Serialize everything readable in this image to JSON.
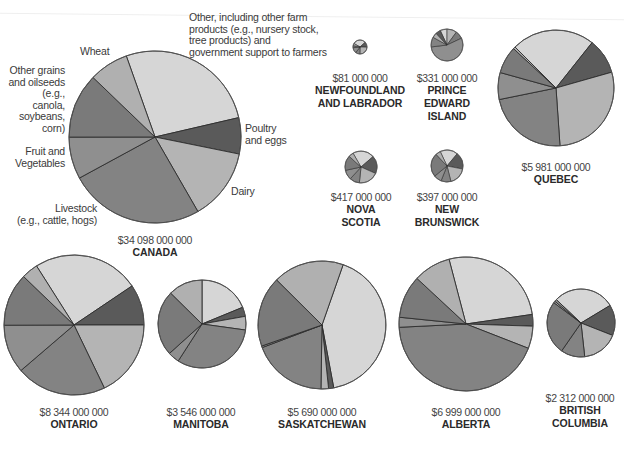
{
  "chart_data": {
    "type": "pie",
    "unit": "$",
    "category_legend": [
      {
        "key": "other",
        "label": "Other, including other farm products (e.g., nursery stock, tree products) and government support to farmers",
        "color": "#d6d6d6"
      },
      {
        "key": "poultry",
        "label": "Poultry and eggs",
        "color": "#5a5a5a"
      },
      {
        "key": "dairy",
        "label": "Dairy",
        "color": "#b4b4b4"
      },
      {
        "key": "livestock",
        "label": "Livestock (e.g., cattle, hogs)",
        "color": "#838383"
      },
      {
        "key": "fruit",
        "label": "Fruit and Vegetables",
        "color": "#8f8f8f"
      },
      {
        "key": "grains",
        "label": "Other grains and oilseeds (e.g., canola, soybeans, corn)",
        "color": "#7a7a7a"
      },
      {
        "key": "wheat",
        "label": "Wheat",
        "color": "#b0b0b0"
      }
    ],
    "pies": [
      {
        "region": "CANADA",
        "total": "$34 098 000 000",
        "cx": 155,
        "cy": 137,
        "r": 86,
        "start": -19.5,
        "slices": [
          [
            "other",
            26.8
          ],
          [
            "poultry",
            6.8
          ],
          [
            "dairy",
            13.5
          ],
          [
            "livestock",
            25.4
          ],
          [
            "fruit",
            7.9
          ],
          [
            "grains",
            12.2
          ],
          [
            "wheat",
            7.4
          ]
        ]
      },
      {
        "region": "NEWFOUNDLAND AND LABRADOR",
        "total": "$81 000 000",
        "cx": 360,
        "cy": 47,
        "r": 7,
        "start": -60,
        "slices": [
          [
            "other",
            30
          ],
          [
            "poultry",
            12
          ],
          [
            "dairy",
            25
          ],
          [
            "livestock",
            10
          ],
          [
            "fruit",
            13
          ],
          [
            "grains",
            5
          ],
          [
            "wheat",
            5
          ]
        ]
      },
      {
        "region": "PRINCE EDWARD ISLAND",
        "total": "$331 000 000",
        "cx": 447,
        "cy": 45,
        "r": 16,
        "start": -25,
        "slices": [
          [
            "other",
            7
          ],
          [
            "dairy",
            10
          ],
          [
            "grains",
            8
          ],
          [
            "fruit",
            55
          ],
          [
            "livestock",
            10
          ],
          [
            "wheat",
            5
          ],
          [
            "poultry",
            5
          ]
        ]
      },
      {
        "region": "NOVA SCOTIA",
        "total": "$417 000 000",
        "cx": 361,
        "cy": 167,
        "r": 16,
        "start": -30,
        "slices": [
          [
            "other",
            22
          ],
          [
            "poultry",
            18
          ],
          [
            "dairy",
            20
          ],
          [
            "livestock",
            10
          ],
          [
            "fruit",
            10
          ],
          [
            "grains",
            15
          ],
          [
            "wheat",
            5
          ]
        ]
      },
      {
        "region": "NEW BRUNSWICK",
        "total": "$397 000 000",
        "cx": 447,
        "cy": 166,
        "r": 16,
        "start": -25,
        "slices": [
          [
            "other",
            18
          ],
          [
            "poultry",
            17
          ],
          [
            "dairy",
            18
          ],
          [
            "livestock",
            10
          ],
          [
            "fruit",
            8
          ],
          [
            "grains",
            24
          ],
          [
            "wheat",
            5
          ]
        ]
      },
      {
        "region": "QUEBEC",
        "total": "$5 981 000 000",
        "cx": 556,
        "cy": 88,
        "r": 58,
        "start": -45,
        "slices": [
          [
            "other",
            23.2
          ],
          [
            "poultry",
            9.9
          ],
          [
            "dairy",
            28.3
          ],
          [
            "livestock",
            22.9
          ],
          [
            "fruit",
            7.5
          ],
          [
            "grains",
            7.6
          ],
          [
            "wheat",
            0.6
          ]
        ]
      },
      {
        "region": "ONTARIO",
        "total": "$8 344 000 000",
        "cx": 74,
        "cy": 325,
        "r": 70,
        "start": -32.4,
        "slices": [
          [
            "other",
            24.5
          ],
          [
            "poultry",
            9.4
          ],
          [
            "dairy",
            17.8
          ],
          [
            "livestock",
            20.8
          ],
          [
            "fruit",
            11.2
          ],
          [
            "grains",
            12.2
          ],
          [
            "wheat",
            3.8
          ]
        ]
      },
      {
        "region": "MANITOBA",
        "total": "$3 546 000 000",
        "cx": 202,
        "cy": 324,
        "r": 44,
        "start": 0,
        "slices": [
          [
            "other",
            18.8
          ],
          [
            "poultry",
            3.4
          ],
          [
            "dairy",
            5.0
          ],
          [
            "livestock",
            31.9
          ],
          [
            "fruit",
            4.2
          ],
          [
            "grains",
            24.1
          ],
          [
            "wheat",
            12.6
          ]
        ]
      },
      {
        "region": "SASKATCHEWAN",
        "total": "$5 690 000 000",
        "cx": 322,
        "cy": 325,
        "r": 64,
        "start": 19.3,
        "slices": [
          [
            "other",
            41.7
          ],
          [
            "poultry",
            1.3
          ],
          [
            "dairy",
            1.9
          ],
          [
            "livestock",
            19.0
          ],
          [
            "fruit",
            0.4
          ],
          [
            "grains",
            17.8
          ],
          [
            "wheat",
            17.9
          ]
        ]
      },
      {
        "region": "ALBERTA",
        "total": "$6 999 000 000",
        "cx": 466,
        "cy": 324,
        "r": 67,
        "start": -14.7,
        "slices": [
          [
            "other",
            26.8
          ],
          [
            "poultry",
            2.8
          ],
          [
            "dairy",
            5.4
          ],
          [
            "livestock",
            43.3
          ],
          [
            "fruit",
            2.4
          ],
          [
            "grains",
            10.3
          ],
          [
            "wheat",
            9.0
          ]
        ]
      },
      {
        "region": "BRITISH COLUMBIA",
        "total": "$2 312 000 000",
        "cx": 581,
        "cy": 323,
        "r": 34,
        "start": -46.6,
        "slices": [
          [
            "other",
            29.3
          ],
          [
            "poultry",
            14.6
          ],
          [
            "dairy",
            17.3
          ],
          [
            "livestock",
            11.4
          ],
          [
            "grains",
            25.6
          ],
          [
            "wheat",
            0.8
          ],
          [
            "fruit",
            1.0
          ]
        ]
      }
    ],
    "annotations": {
      "other": "Other, including other farm products (e.g., nursery stock, tree products) and government support to farmers",
      "wheat": "Wheat",
      "grains": "Other grains and oilseeds (e.g., canola, soybeans, corn)",
      "fruit": "Fruit and Vegetables",
      "livestock": "Livestock (e.g., cattle, hogs)",
      "poultry": "Poultry and eggs",
      "dairy": "Dairy"
    }
  },
  "labels": {
    "other_lines": [
      "Other, including other farm",
      "products (e.g., nursery stock,",
      "tree products) and",
      "government support to farmers"
    ],
    "wheat": "Wheat",
    "grains_lines": [
      "Other grains",
      "and oilseeds",
      "(e.g., canola,",
      "soybeans,",
      "corn)"
    ],
    "fruit_lines": [
      "Fruit and",
      "Vegetables"
    ],
    "livestock_lines": [
      "Livestock",
      "(e.g., cattle, hogs)"
    ],
    "poultry_lines": [
      "Poultry",
      "and eggs"
    ],
    "dairy": "Dairy"
  },
  "captions": [
    {
      "value": "$34 098 000 000",
      "name_lines": [
        "CANADA"
      ]
    },
    {
      "value": "$81 000 000",
      "name_lines": [
        "NEWFOUNDLAND",
        "AND LABRADOR"
      ]
    },
    {
      "value": "$331 000 000",
      "name_lines": [
        "PRINCE",
        "EDWARD",
        "ISLAND"
      ]
    },
    {
      "value": "$417 000 000",
      "name_lines": [
        "NOVA",
        "SCOTIA"
      ]
    },
    {
      "value": "$397 000 000",
      "name_lines": [
        "NEW",
        "BRUNSWICK"
      ]
    },
    {
      "value": "$5 981 000 000",
      "name_lines": [
        "QUEBEC"
      ]
    },
    {
      "value": "$8 344 000 000",
      "name_lines": [
        "ONTARIO"
      ]
    },
    {
      "value": "$3 546 000 000",
      "name_lines": [
        "MANITOBA"
      ]
    },
    {
      "value": "$5 690 000 000",
      "name_lines": [
        "SASKATCHEWAN"
      ]
    },
    {
      "value": "$6 999 000 000",
      "name_lines": [
        "ALBERTA"
      ]
    },
    {
      "value": "$2 312 000 000",
      "name_lines": [
        "BRITISH",
        "COLUMBIA"
      ]
    }
  ]
}
